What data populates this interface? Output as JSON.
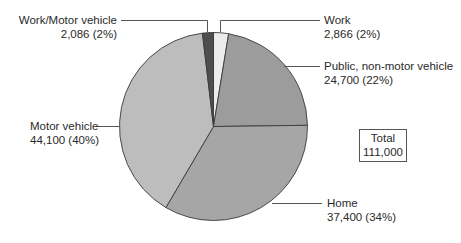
{
  "chart_data": {
    "type": "pie",
    "title": "",
    "total_label": "Total",
    "total_value": "111,000",
    "total": 111000,
    "slices": [
      {
        "name": "Work",
        "value": 2866,
        "percent": 2,
        "value_label": "2,866 (2%)",
        "color": "#ececec"
      },
      {
        "name": "Public, non-motor vehicle",
        "value": 24700,
        "percent": 22,
        "value_label": "24,700 (22%)",
        "color": "#9c9c9c"
      },
      {
        "name": "Home",
        "value": 37400,
        "percent": 34,
        "value_label": "37,400 (34%)",
        "color": "#a6a6a6"
      },
      {
        "name": "Motor vehicle",
        "value": 44100,
        "percent": 40,
        "value_label": "44,100 (40%)",
        "color": "#bdbdbd"
      },
      {
        "name": "Work/Motor vehicle",
        "value": 2086,
        "percent": 2,
        "value_label": "2,086 (2%)",
        "color": "#4e4e4e"
      }
    ],
    "start_angle_deg": 0,
    "direction": "clockwise",
    "legend_position": "callout labels"
  },
  "labels": {
    "work": {
      "name": "Work",
      "value": "2,866 (2%)"
    },
    "public": {
      "name": "Public, non-motor vehicle",
      "value": "24,700 (22%)"
    },
    "home": {
      "name": "Home",
      "value": "37,400 (34%)"
    },
    "motor": {
      "name": "Motor vehicle",
      "value": "44,100 (40%)"
    },
    "work_motor": {
      "name": "Work/Motor vehicle",
      "value": "2,086 (2%)"
    }
  },
  "total_box": {
    "label": "Total",
    "value": "111,000"
  }
}
